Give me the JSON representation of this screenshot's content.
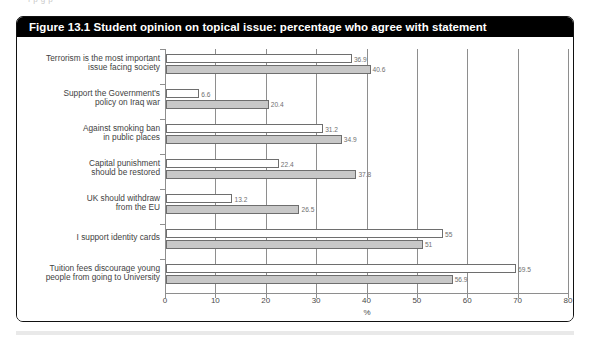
{
  "page": {
    "top_bleed_text": "f  p       g    p"
  },
  "figure": {
    "title": "Figure 13.1 Student opinion on topical issue: percentage who agree with statement"
  },
  "legend": {
    "items": [
      {
        "label": "Males",
        "swatch": "males",
        "color": "#c8c8c8"
      },
      {
        "label": "Females",
        "swatch": "females",
        "color": "#ffffff"
      }
    ]
  },
  "axis": {
    "x_name": "%",
    "ticks": [
      "0",
      "10",
      "20",
      "30",
      "40",
      "50",
      "60",
      "70",
      "80"
    ]
  },
  "chart_data": {
    "type": "bar",
    "orientation": "horizontal",
    "title": "Figure 13.1 Student opinion on topical issue: percentage who agree with statement",
    "xlabel": "%",
    "ylabel": "",
    "xlim": [
      0,
      80
    ],
    "xticks": [
      0,
      10,
      20,
      30,
      40,
      50,
      60,
      70,
      80
    ],
    "grid": "vertical",
    "legend_position": "bottom-center",
    "categories": [
      "Terrorism is the most important issue facing society",
      "Support the Government's policy on Iraq war",
      "Against smoking ban in public places",
      "Capital punishment should be restored",
      "UK should withdraw from the EU",
      "I support identity cards",
      "Tuition fees discourage young people from going to University"
    ],
    "category_lines": [
      [
        "Terrorism is the most important",
        "issue facing society"
      ],
      [
        "Support the Government's",
        "policy on Iraq war"
      ],
      [
        "Against smoking ban",
        "in public places"
      ],
      [
        "Capital punishment",
        "should be restored"
      ],
      [
        "UK should withdraw",
        "from the EU"
      ],
      [
        "I support identity cards"
      ],
      [
        "Tuition fees discourage young",
        "people from going to University"
      ]
    ],
    "series": [
      {
        "name": "Females",
        "color": "#ffffff",
        "values": [
          36.9,
          6.6,
          31.2,
          22.4,
          13.2,
          55,
          69.5
        ],
        "labels": [
          "36.9",
          "6.6",
          "31.2",
          "22.4",
          "13.2",
          "55",
          "69.5"
        ]
      },
      {
        "name": "Males",
        "color": "#c8c8c8",
        "values": [
          40.6,
          20.4,
          34.9,
          37.8,
          26.5,
          51,
          56.9
        ],
        "labels": [
          "40.6",
          "20.4",
          "34.9",
          "37.8",
          "26.5",
          "51",
          "56.9"
        ]
      }
    ]
  }
}
